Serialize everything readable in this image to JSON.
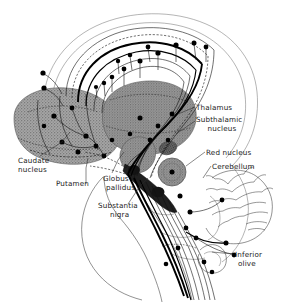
{
  "figure": {
    "background_color": "#ffffff",
    "ink_color": "#111111",
    "nucleus_fill_color": "#9a9a9a",
    "dark_nucleus_color": "#2b2b2b",
    "width": 285,
    "height": 302
  },
  "labels": [
    {
      "id": "thalamus",
      "text": "Thalamus",
      "line2": "",
      "x": 196,
      "y": 110,
      "align": "start"
    },
    {
      "id": "subthalamic-nucleus",
      "text": "Subthalamic",
      "line2": "nucleus",
      "x": 196,
      "y": 122,
      "align": "start"
    },
    {
      "id": "red-nucleus",
      "text": "Red  nucleus",
      "line2": "",
      "x": 206,
      "y": 155,
      "align": "start"
    },
    {
      "id": "cerebellum",
      "text": "Cerebellum",
      "line2": "",
      "x": 212,
      "y": 169,
      "align": "start"
    },
    {
      "id": "caudate-nucleus",
      "text": "Caudate",
      "line2": "nucleus",
      "x": 18,
      "y": 163,
      "align": "start"
    },
    {
      "id": "putamen",
      "text": "Putamen",
      "line2": "",
      "x": 56,
      "y": 186,
      "align": "start"
    },
    {
      "id": "globus-pallidus",
      "text": "Globus",
      "line2": "pallidus",
      "x": 103,
      "y": 181,
      "align": "start"
    },
    {
      "id": "substantia-nigra",
      "text": "Substantia",
      "line2": "nigra",
      "x": 98,
      "y": 208,
      "align": "start"
    },
    {
      "id": "inferior-olive",
      "text": "Inferior",
      "line2": "olive",
      "x": 235,
      "y": 257,
      "align": "start"
    }
  ],
  "structures": [
    {
      "id": "caudate-putamen",
      "name": "Caudate nucleus and putamen (striatum)",
      "shading": "stippled-gray"
    },
    {
      "id": "thalamus-body",
      "name": "Thalamus",
      "shading": "stippled-gray"
    },
    {
      "id": "globus-pallidus-body",
      "name": "Globus pallidus",
      "shading": "stippled-gray"
    },
    {
      "id": "subthalamic-body",
      "name": "Subthalamic nucleus",
      "shading": "stippled-gray"
    },
    {
      "id": "red-nucleus-body",
      "name": "Red nucleus",
      "shading": "stippled-gray"
    },
    {
      "id": "substantia-nigra-body",
      "name": "Substantia nigra",
      "shading": "solid-dark"
    },
    {
      "id": "cerebellum-body",
      "name": "Cerebellum",
      "shading": "outline-folia"
    },
    {
      "id": "inferior-olive-body",
      "name": "Inferior olive",
      "shading": "outline"
    },
    {
      "id": "cortex-outline",
      "name": "Cerebral cortex outline",
      "shading": "outline"
    },
    {
      "id": "brainstem-outline",
      "name": "Brainstem and spinal cord outline",
      "shading": "outline"
    }
  ],
  "pathways": [
    {
      "id": "corticofugal",
      "name": "Corticofugal fibers",
      "style": "solid-thick"
    },
    {
      "id": "thalamocortical",
      "name": "Thalamocortical fibers",
      "style": "solid-thin"
    },
    {
      "id": "nigrostriatal",
      "name": "Nigrostriatal fibers",
      "style": "dashed"
    },
    {
      "id": "corticospinal",
      "name": "Corticospinal tract",
      "style": "solid-thick"
    },
    {
      "id": "olivocerebellar",
      "name": "Olivocerebellar fibers",
      "style": "solid-thin"
    }
  ]
}
